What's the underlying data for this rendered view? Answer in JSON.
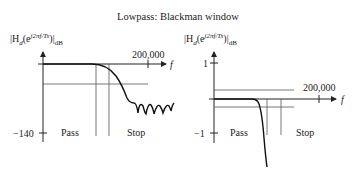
{
  "title": "Lowpass: Blackman window",
  "left_plot": {
    "ylabel_base": "|H",
    "ylabel_sub_d": "d",
    "ylabel_open": "(e",
    "ylabel_exp": "j2πf/Ts",
    "ylabel_close": ")|",
    "ylabel_unit": "dB",
    "x_axis_label": "f",
    "x_tick_label": "200,000",
    "y_tick_label": "−140",
    "pass_label": "Pass",
    "stop_label": "Stop"
  },
  "right_plot": {
    "ylabel_base": "|H",
    "ylabel_sub_d": "d",
    "ylabel_open": "(e",
    "ylabel_exp": "j2πf/Ts",
    "ylabel_close": ")|",
    "ylabel_unit": "dB",
    "x_axis_label": "f",
    "x_tick_label": "200,000",
    "y_tick_top_label": "1",
    "y_tick_bottom_label": "−1",
    "pass_label": "Pass",
    "stop_label": "Stop"
  },
  "colors": {
    "axis": "#222222",
    "grid_line": "#555555",
    "curve": "#111111"
  }
}
